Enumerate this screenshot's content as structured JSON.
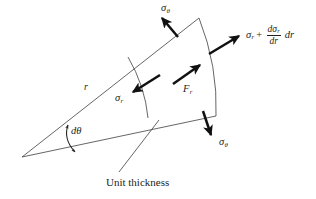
{
  "figure": {
    "type": "engineering-stress-element-diagram",
    "caption": "Unit thickness",
    "background_color": "#ffffff",
    "line_color": "#231f20",
    "arrow_color": "#111111"
  },
  "labels": {
    "sigma_theta_top": {
      "symbol": "σ",
      "subscript": "θ",
      "text": "σθ"
    },
    "sigma_theta_bottom": {
      "symbol": "σ",
      "subscript": "θ",
      "text": "σθ"
    },
    "sigma_r_inner": {
      "symbol": "σ",
      "subscript": "r",
      "text": "σr"
    },
    "force_r": {
      "symbol": "F",
      "subscript": "r",
      "text": "Fr"
    },
    "radius": {
      "symbol": "r",
      "text": "r"
    },
    "d_theta": {
      "text": "dθ",
      "d": "d",
      "theta": "θ"
    },
    "unit_thickness": {
      "text": "Unit thickness"
    },
    "sigma_r_outer": {
      "base_symbol": "σ",
      "base_subscript": "r",
      "operator": "+",
      "fraction_numerator_d": "d",
      "fraction_numerator_symbol": "σ",
      "fraction_numerator_subscript": "r",
      "fraction_denominator": "dr",
      "trailing": "dr",
      "full_text": "σr + (dσr/dr) dr"
    }
  },
  "geometry": {
    "apex": {
      "x": 22,
      "y": 157
    },
    "upper_radial_line_end": {
      "x": 199,
      "y": 18
    },
    "lower_radial_line_end": {
      "x": 216,
      "y": 116
    },
    "inner_arc": {
      "start_x": 128,
      "start_y": 57,
      "end_x": 148,
      "end_y": 118
    },
    "outer_arc": {
      "start_x": 199,
      "start_y": 18,
      "end_x": 216,
      "end_y": 116
    },
    "wedge_angle_label": "dθ"
  },
  "arrows": [
    {
      "name": "sigma-theta-top-arrow",
      "direction": "up-left",
      "from_x": 178,
      "from_y": 36,
      "to_x": 160,
      "to_y": 16
    },
    {
      "name": "sigma-r-outer-arrow",
      "direction": "up-right",
      "from_x": 209,
      "from_y": 53,
      "to_x": 240,
      "to_y": 35
    },
    {
      "name": "force-r-arrow",
      "direction": "up-right",
      "from_x": 172,
      "from_y": 83,
      "to_x": 200,
      "to_y": 64
    },
    {
      "name": "sigma-r-inner-arrow",
      "direction": "down-left",
      "from_x": 160,
      "from_y": 74,
      "to_x": 131,
      "to_y": 92
    },
    {
      "name": "sigma-theta-bottom-arrow",
      "direction": "down",
      "from_x": 203,
      "from_y": 110,
      "to_x": 212,
      "to_y": 136
    },
    {
      "name": "d-theta-double-arrow",
      "direction": "arc-double",
      "from_x": 70,
      "from_y": 126,
      "to_x": 76,
      "to_y": 151
    },
    {
      "name": "unit-thickness-leader-line",
      "direction": "up-right",
      "from_x": 118,
      "from_y": 172,
      "to_x": 158,
      "to_y": 120
    }
  ]
}
